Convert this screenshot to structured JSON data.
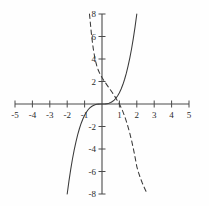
{
  "chart_data": {
    "type": "line",
    "title": "",
    "xlabel": "",
    "ylabel": "",
    "xlim": [
      -5,
      5
    ],
    "ylim": [
      -8,
      8
    ],
    "grid": false,
    "legend": "none",
    "axis_style": "cartesian-cross",
    "xticks": [
      -5,
      -4,
      -3,
      -2,
      -1,
      1,
      2,
      3,
      4,
      5
    ],
    "xtick_labels": [
      "-5",
      "-4",
      "-3",
      "-2",
      "-1",
      "1",
      "2",
      "3",
      "4",
      "5"
    ],
    "yticks": [
      8,
      6,
      4,
      2,
      -2,
      -4,
      -6,
      -8
    ],
    "ytick_labels": [
      "8",
      "6",
      "4",
      "2",
      "-2",
      "-4",
      "-6",
      "-8"
    ],
    "series": [
      {
        "name": "solid-cubic",
        "style": "solid",
        "color": "#3a3a3a",
        "x": [
          -2.0,
          -1.9,
          -1.8,
          -1.7,
          -1.6,
          -1.5,
          -1.4,
          -1.3,
          -1.2,
          -1.1,
          -1.0,
          -0.9,
          -0.8,
          -0.7,
          -0.6,
          -0.5,
          -0.4,
          -0.3,
          -0.2,
          -0.1,
          0.0,
          0.1,
          0.2,
          0.3,
          0.4,
          0.5,
          0.6,
          0.7,
          0.8,
          0.9,
          1.0,
          1.1,
          1.2,
          1.3,
          1.4,
          1.5,
          1.6,
          1.7,
          1.8,
          1.9,
          2.0
        ],
        "y": [
          -8.0,
          -6.86,
          -5.83,
          -4.91,
          -4.1,
          -3.38,
          -2.74,
          -2.2,
          -1.73,
          -1.33,
          -1.0,
          -0.73,
          -0.51,
          -0.34,
          -0.22,
          -0.13,
          -0.06,
          -0.03,
          -0.01,
          0.0,
          0.0,
          0.0,
          0.01,
          0.03,
          0.06,
          0.13,
          0.22,
          0.34,
          0.51,
          0.73,
          1.0,
          1.33,
          1.73,
          2.2,
          2.74,
          3.38,
          4.1,
          4.91,
          5.83,
          6.86,
          8.0
        ]
      },
      {
        "name": "dashed-decreasing",
        "style": "dashed",
        "color": "#3a3a3a",
        "x": [
          -0.72,
          -0.6,
          -0.5,
          -0.4,
          -0.3,
          -0.2,
          -0.1,
          0.0,
          0.1,
          0.2,
          0.3,
          0.4,
          0.5,
          0.6,
          0.7,
          0.8,
          0.9,
          1.0,
          1.1,
          1.2,
          1.3,
          1.4,
          1.5,
          1.6,
          1.7,
          1.8,
          1.9,
          2.0,
          2.1,
          2.2,
          2.3,
          2.4,
          2.5,
          2.6
        ],
        "y": [
          8.0,
          6.1,
          4.9,
          4.0,
          3.4,
          2.95,
          2.62,
          2.35,
          2.1,
          1.88,
          1.66,
          1.44,
          1.22,
          1.0,
          0.76,
          0.52,
          0.26,
          0.0,
          -0.32,
          -0.68,
          -1.08,
          -1.54,
          -2.05,
          -2.62,
          -3.25,
          -3.95,
          -4.72,
          -5.56,
          -6.1,
          -6.55,
          -6.96,
          -7.32,
          -7.66,
          -8.0
        ]
      }
    ]
  },
  "figure": {
    "background": "#fefefe",
    "axis_color": "#4a4a4a",
    "tick_color": "#4a4a4a",
    "label_color": "#2b2b2b"
  }
}
